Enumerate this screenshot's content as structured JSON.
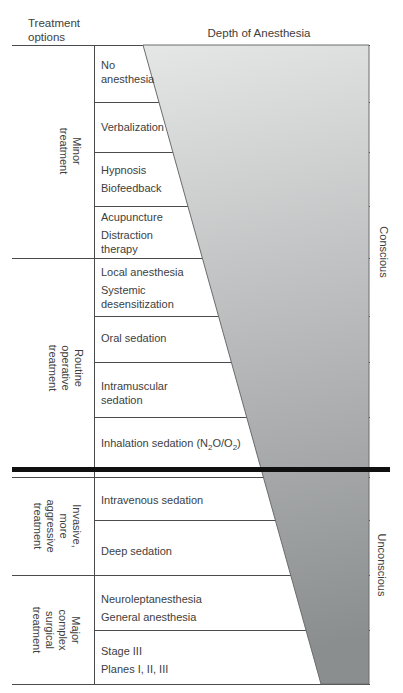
{
  "titles": {
    "treatment_options": "Treatment\noptions",
    "depth_axis": "Depth of Anesthesia"
  },
  "depth_labels": {
    "conscious": "Conscious",
    "unconscious": "Unconscious"
  },
  "sections": [
    {
      "label": "Minor\ntreatment"
    },
    {
      "label": "Routine\noperative\ntreatment"
    },
    {
      "label": "Invasive,\nmore\naggressive\ntreatment"
    },
    {
      "label": "Major\ncomplex\nsurgical\ntreatment"
    }
  ],
  "rows": [
    {
      "items": [
        "No\nanesthesia"
      ]
    },
    {
      "items": [
        "Verbalization"
      ]
    },
    {
      "items": [
        "Hypnosis",
        "Biofeedback"
      ]
    },
    {
      "items": [
        "Acupuncture",
        "Distraction\ntherapy"
      ]
    },
    {
      "items": [
        "Local anesthesia",
        "Systemic\ndesensitization"
      ]
    },
    {
      "items": [
        "Oral sedation"
      ]
    },
    {
      "items": [
        "Intramuscular\nsedation"
      ]
    },
    {
      "parts": [
        "Inhalation sedation (N",
        "2",
        "O/O",
        "2",
        ")"
      ]
    },
    {
      "items": [
        "Intravenous sedation"
      ]
    },
    {
      "items": [
        "Deep sedation"
      ]
    },
    {
      "items": [
        "Neuroleptanesthesia",
        "General anesthesia"
      ]
    },
    {
      "items": [
        "Stage III",
        "Planes I, II, III"
      ]
    }
  ],
  "colors": {
    "wedge_top": "#e5e6e6",
    "wedge_bottom": "#8b8e8f",
    "wedge_edge": "#6a6c6e",
    "line": "#4a4b4d",
    "threshold_line": "#101010",
    "text": "#3d3e40"
  }
}
